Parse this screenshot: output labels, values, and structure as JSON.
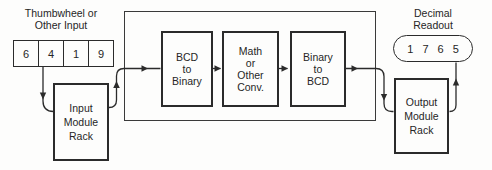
{
  "thumbwheel": {
    "label_line1": "Thumbwheel or",
    "label_line2": "Other Input",
    "digits": [
      "6",
      "4",
      "1",
      "9"
    ]
  },
  "input_rack": {
    "lines": [
      "Input",
      "Module",
      "Rack"
    ]
  },
  "processors": [
    {
      "lines": [
        "BCD",
        "to",
        "Binary"
      ]
    },
    {
      "lines": [
        "Math",
        "or",
        "Other",
        "Conv."
      ]
    },
    {
      "lines": [
        "Binary",
        "to",
        "BCD"
      ]
    }
  ],
  "output_rack": {
    "lines": [
      "Output",
      "Module",
      "Rack"
    ]
  },
  "readout": {
    "label_line1": "Decimal",
    "label_line2": "Readout",
    "digits": [
      "1",
      "7",
      "6",
      "5"
    ]
  },
  "colors": {
    "stroke": "#2b2b2b",
    "background": "#fdfdfc"
  }
}
